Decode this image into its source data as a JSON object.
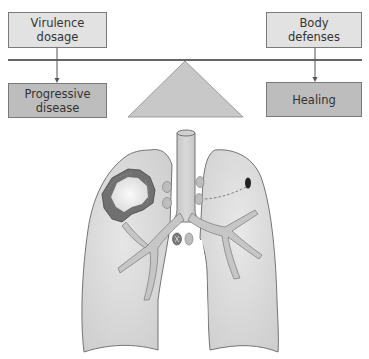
{
  "diagram": {
    "boxes": {
      "virulence": {
        "line1": "Virulence",
        "line2": "dosage"
      },
      "defenses": {
        "line1": "Body",
        "line2": "defenses"
      },
      "progressive": {
        "line1": "Progressive",
        "line2": "disease"
      },
      "healing": {
        "label": "Healing"
      }
    },
    "illustration": {
      "subject": "lungs-with-cavitary-lesion",
      "left_lung_label": "",
      "right_lung_label": ""
    },
    "colors": {
      "light_box": "#e2e2e2",
      "dark_box": "#bdbdbd",
      "lung_fill": "#d6d6d6",
      "lesion": "#6e6e6e",
      "fulcrum": "#c8c8c8"
    }
  }
}
